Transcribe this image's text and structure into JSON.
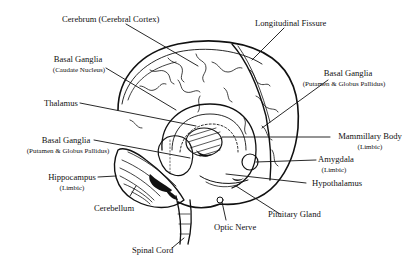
{
  "diagram": {
    "colors": {
      "ink": "#111111",
      "background": "#ffffff"
    },
    "labels": [
      {
        "id": "cerebrum",
        "title": "Cerebrum (Cerebral Cortex)",
        "sub": ""
      },
      {
        "id": "longitudinal-fissure",
        "title": "Longitudinal Fissure",
        "sub": ""
      },
      {
        "id": "basal-ganglia-caudate",
        "title": "Basal Ganglia",
        "sub": "(Caudate Nucleus)"
      },
      {
        "id": "basal-ganglia-putamen-right",
        "title": "Basal Ganglia",
        "sub": "(Putamen & Globus Pallidus)"
      },
      {
        "id": "thalamus",
        "title": "Thalamus",
        "sub": ""
      },
      {
        "id": "mammillary-body",
        "title": "Mammillary Body",
        "sub": "(Limbic)"
      },
      {
        "id": "basal-ganglia-putamen-left",
        "title": "Basal Ganglia",
        "sub": "(Putamen & Globus Pallidus)"
      },
      {
        "id": "amygdala",
        "title": "Amygdala",
        "sub": "(Limbic)"
      },
      {
        "id": "hippocampus",
        "title": "Hippocampus",
        "sub": "(Limbic)"
      },
      {
        "id": "hypothalamus",
        "title": "Hypothalamus",
        "sub": ""
      },
      {
        "id": "cerebellum",
        "title": "Cerebellum",
        "sub": ""
      },
      {
        "id": "pituitary-gland",
        "title": "Pituitary Gland",
        "sub": ""
      },
      {
        "id": "optic-nerve",
        "title": "Optic Nerve",
        "sub": ""
      },
      {
        "id": "spinal-cord",
        "title": "Spinal Cord",
        "sub": ""
      }
    ]
  }
}
